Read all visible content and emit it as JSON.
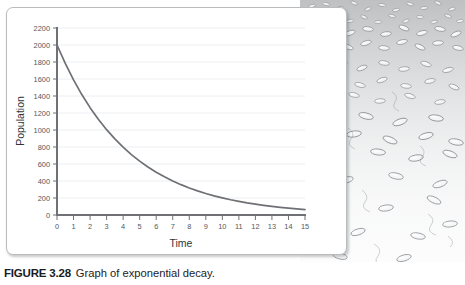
{
  "figure": {
    "label": "FIGURE 3.28",
    "caption": "Graph of exponential decay."
  },
  "illustration": {
    "name": "bacteria-colony-illustration",
    "description": "Grayscale drawing of rod-shaped bacteria, dense at top and sparse toward the bottom"
  },
  "chart_data": {
    "type": "line",
    "title": "",
    "xlabel": "Time",
    "ylabel": "Population",
    "xlim": [
      0,
      15
    ],
    "ylim": [
      0,
      2200
    ],
    "grid": true,
    "legend": "none",
    "xticks": [
      "0",
      "1",
      "2",
      "3",
      "4",
      "5",
      "6",
      "7",
      "8",
      "9",
      "10",
      "11",
      "12",
      "13",
      "14",
      "15"
    ],
    "yticks": [
      "0",
      "200",
      "400",
      "600",
      "800",
      "1000",
      "1200",
      "1400",
      "1600",
      "1800",
      "2000",
      "2200"
    ],
    "series": [
      {
        "name": "Population",
        "color": "#6e7075",
        "x": [
          0,
          0.5,
          1,
          1.5,
          2,
          2.5,
          3,
          3.5,
          4,
          4.5,
          5,
          5.5,
          6,
          6.5,
          7,
          7.5,
          8,
          8.5,
          9,
          9.5,
          10,
          10.5,
          11,
          11.5,
          12,
          12.5,
          13,
          13.5,
          14,
          14.5,
          15
        ],
        "y": [
          2000,
          1783,
          1589,
          1417,
          1263,
          1126,
          1004,
          895,
          798,
          711,
          634,
          565,
          504,
          449,
          400,
          357,
          318,
          284,
          253,
          225,
          201,
          179,
          160,
          142,
          127,
          113,
          101,
          90,
          80,
          71,
          64
        ]
      }
    ]
  }
}
